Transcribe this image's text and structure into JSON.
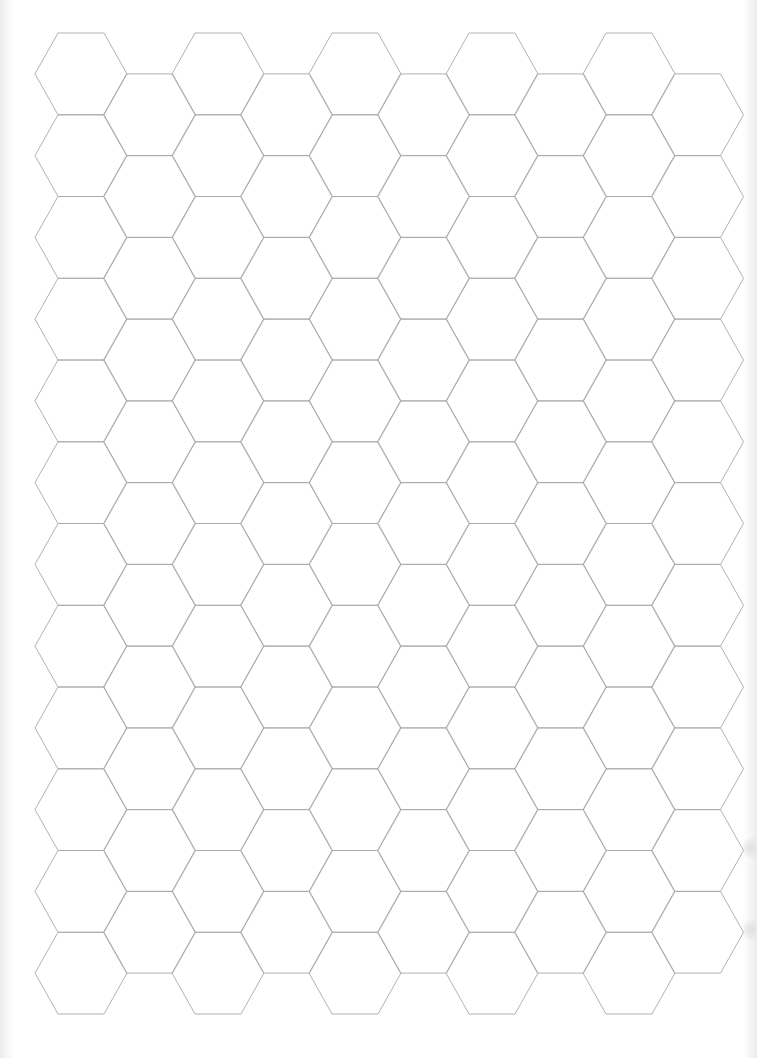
{
  "page": {
    "type": "hex-grid-paper",
    "background_color": "#ffffff",
    "line_color": "#a9a9a9",
    "orientation": "flat-top"
  },
  "grid": {
    "columns": 10,
    "even_column_rows": 12,
    "odd_column_rows": 11,
    "hex_side_px": 46,
    "hex_height_px": 81.75,
    "column_spacing_px": 68.5,
    "first_center_x": 81,
    "first_top_y": 33
  },
  "artifacts": {
    "edge_smudges_y": [
      848,
      930
    ]
  }
}
